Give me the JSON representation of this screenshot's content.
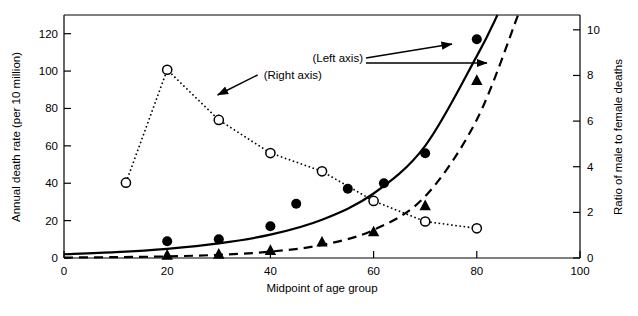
{
  "chart_data": {
    "type": "scatter",
    "title": "",
    "xlabel": "Midpoint of age group",
    "ylabel": "Annual death rate (per 10 million)",
    "y2label": "Ratio of male to female deaths",
    "xlim": [
      0,
      100
    ],
    "ylim": [
      0,
      130
    ],
    "y2lim": [
      0,
      10.65
    ],
    "xticks": [
      0,
      20,
      40,
      60,
      80,
      100
    ],
    "xtick_labels": [
      "0",
      "20",
      "40",
      "60",
      "80",
      "100"
    ],
    "yticks": [
      0,
      20,
      40,
      60,
      80,
      100,
      120
    ],
    "ytick_labels": [
      "0",
      "20",
      "40",
      "60",
      "80",
      "100",
      "120"
    ],
    "y2ticks": [
      0,
      2,
      4,
      6,
      8,
      10
    ],
    "y2tick_labels": [
      "0",
      "2",
      "4",
      "6",
      "8",
      "10"
    ],
    "grid": false,
    "legend": "none",
    "annotations": [
      {
        "text": "(Right axis)",
        "x": 38.5,
        "y": 97,
        "arrow_to_x": 29.0,
        "arrow_to_y": 88
      },
      {
        "text": "(Left axis)",
        "x": 57.0,
        "y": 111,
        "arrow_to_x": 75.0,
        "arrow_to_y": 117
      },
      {
        "text": "(Left axis)",
        "x": 57.0,
        "y": 111,
        "arrow_to_x": 81.0,
        "arrow_to_y": 104
      }
    ],
    "series": [
      {
        "name": "Ratio of male to female deaths",
        "axis": "right",
        "marker": "open-circle",
        "linestyle": "dotted",
        "color": "#000000",
        "x": [
          12,
          20,
          30,
          40,
          50,
          60,
          70,
          80
        ],
        "values": [
          3.3,
          8.25,
          6.05,
          4.6,
          3.8,
          2.5,
          1.6,
          1.3
        ]
      },
      {
        "name": "Male annual death rate",
        "axis": "left",
        "marker": "filled-circle",
        "linestyle": "none",
        "color": "#000000",
        "x": [
          20,
          30,
          40,
          45,
          55,
          62,
          70,
          80
        ],
        "values": [
          9,
          10,
          17,
          29,
          37,
          40,
          56,
          117
        ]
      },
      {
        "name": "Female annual death rate",
        "axis": "left",
        "marker": "filled-triangle",
        "linestyle": "none",
        "color": "#000000",
        "x": [
          20,
          30,
          40,
          50,
          60,
          70,
          80
        ],
        "values": [
          1.5,
          2,
          4,
          8.5,
          14,
          28,
          95
        ]
      },
      {
        "name": "Male fitted curve",
        "axis": "left",
        "marker": "none",
        "linestyle": "solid",
        "color": "#000000",
        "fit": "exponential",
        "x": [
          0,
          10,
          20,
          30,
          40,
          50,
          60,
          70,
          80,
          84
        ],
        "values": [
          2.0,
          3.1,
          4.9,
          7.8,
          12.5,
          20.5,
          34.5,
          60.0,
          108.0,
          130.0
        ]
      },
      {
        "name": "Female fitted curve",
        "axis": "left",
        "marker": "none",
        "linestyle": "dashed",
        "color": "#000000",
        "fit": "exponential",
        "x": [
          0,
          10,
          20,
          30,
          40,
          50,
          60,
          70,
          80,
          88
        ],
        "values": [
          0.25,
          0.45,
          0.85,
          1.7,
          3.4,
          7.0,
          15.0,
          33.0,
          74.0,
          130.0
        ]
      }
    ]
  },
  "labels": {
    "y_axis_title": "Annual death rate (per 10 million)",
    "y2_axis_title": "Ratio of male to female deaths",
    "x_axis_title": "Midpoint of age group",
    "right_axis_annotation": "(Right axis)",
    "left_axis_annotation": "(Left axis)"
  }
}
